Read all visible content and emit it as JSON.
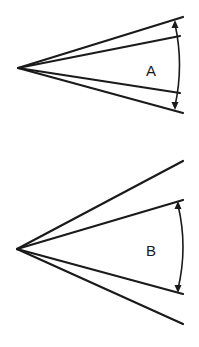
{
  "figure": {
    "background": "#ffffff",
    "line_color": "#1a1a1a"
  },
  "diagrams": [
    {
      "label": "A",
      "description": "Two pairs of lines from a common apex; the arc arrow measures the angle between the outer pair",
      "apex": [
        18,
        68
      ],
      "outer_lines": [
        [
          183,
          17
        ],
        [
          183,
          113
        ]
      ],
      "inner_lines": [
        [
          180,
          36
        ],
        [
          180,
          93
        ]
      ],
      "measured_angle": "outer",
      "arc": {
        "start": [
          175,
          22
        ],
        "end": [
          175,
          108
        ],
        "bulge_x": 182
      },
      "label_pos": [
        146,
        76
      ]
    },
    {
      "label": "B",
      "description": "Two pairs of lines from a common apex; the arc arrow measures the angle between the inner pair",
      "apex": [
        17,
        249
      ],
      "outer_lines": [
        [
          183,
          161
        ],
        [
          183,
          324
        ]
      ],
      "inner_lines": [
        [
          183,
          200
        ],
        [
          183,
          294
        ]
      ],
      "measured_angle": "inner",
      "arc": {
        "start": [
          178,
          203
        ],
        "end": [
          178,
          291
        ],
        "bulge_x": 185
      },
      "label_pos": [
        146,
        256
      ]
    }
  ]
}
